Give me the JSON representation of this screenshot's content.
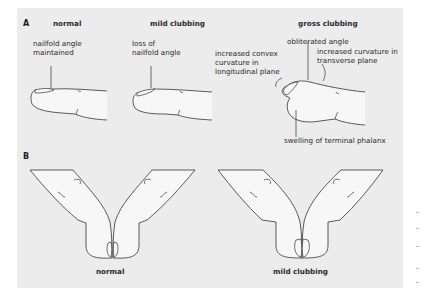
{
  "panel": {
    "background": "#ececec"
  },
  "section_a": {
    "marker": "A",
    "normal": {
      "title": "normal",
      "annotation_line1": "nailfold angle",
      "annotation_line2": "maintained"
    },
    "mild": {
      "title": "mild clubbing",
      "annotation_line1": "loss of",
      "annotation_line2": "nailfold angle"
    },
    "gross": {
      "title": "gross clubbing",
      "obliterated": "obliterated angle",
      "convex_line1": "increased convex",
      "convex_line2": "curvature in",
      "convex_line3": "longitudinal plane",
      "transverse_line1": "increased curvature in",
      "transverse_line2": "transverse plane",
      "swelling": "swelling of terminal phalanx"
    }
  },
  "section_b": {
    "marker": "B",
    "left_caption": "normal",
    "right_caption": "mild clubbing"
  }
}
